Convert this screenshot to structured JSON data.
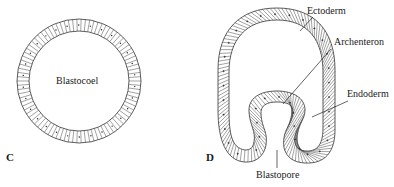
{
  "figure": {
    "panels": [
      {
        "id": "C",
        "label": "C",
        "stage": "blastula",
        "cavity_label": "Blastocoel"
      },
      {
        "id": "D",
        "label": "D",
        "stage": "gastrula",
        "labels": {
          "ectoderm": "Ectoderm",
          "archenteron": "Archenteron",
          "endoderm": "Endoderm",
          "blastopore": "Blastopore"
        }
      }
    ],
    "colors": {
      "line": "#333333",
      "background": "#ffffff",
      "text": "#1a1a1a"
    }
  }
}
